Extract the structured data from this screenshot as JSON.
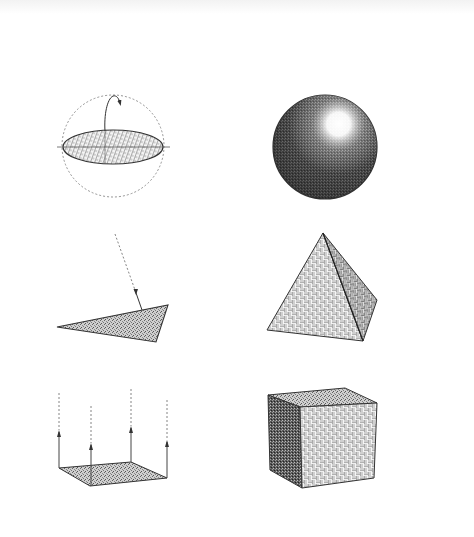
{
  "figure": {
    "colors": {
      "background": "#ffffff",
      "stroke": "#333333",
      "hatch_light": "#9a9a9a",
      "hatch_dark": "#4a4a4a",
      "dashed": "#888888"
    },
    "panels": [
      {
        "id": "ellipse-in-circle",
        "row": 1,
        "col": 1,
        "label": "ellipse disk in dashed sphere with rotation arrow"
      },
      {
        "id": "shaded-sphere",
        "row": 1,
        "col": 2,
        "label": "shaded sphere with highlight"
      },
      {
        "id": "triangle-with-ray",
        "row": 2,
        "col": 1,
        "label": "triangle surface with incoming dashed ray"
      },
      {
        "id": "pyramid",
        "row": 2,
        "col": 2,
        "label": "square pyramid"
      },
      {
        "id": "plane-with-normals",
        "row": 3,
        "col": 1,
        "label": "parallelogram plane with four upward arrows"
      },
      {
        "id": "cube",
        "row": 3,
        "col": 2,
        "label": "cube"
      }
    ]
  }
}
